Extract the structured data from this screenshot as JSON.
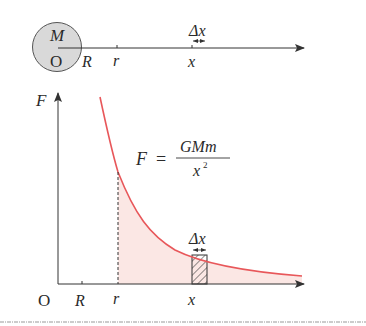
{
  "top_figure": {
    "planet_mass_label": "M",
    "origin_label": "O",
    "radius_label": "R",
    "r_label": "r",
    "x_label": "x",
    "dx_label": "Δx"
  },
  "graph": {
    "y_axis_label": "F",
    "origin_label": "O",
    "radius_tick_label": "R",
    "r_tick_label": "r",
    "x_tick_label": "x",
    "dx_label": "Δx",
    "formula": {
      "lhs": "F",
      "equals": "=",
      "numerator": "GMm",
      "denominator_base": "x",
      "denominator_exp": "2"
    }
  },
  "colors": {
    "curve": "#e8575a",
    "shade": "#fbe7e4",
    "planet_fill": "#d9d9d9",
    "axis": "#333333"
  }
}
